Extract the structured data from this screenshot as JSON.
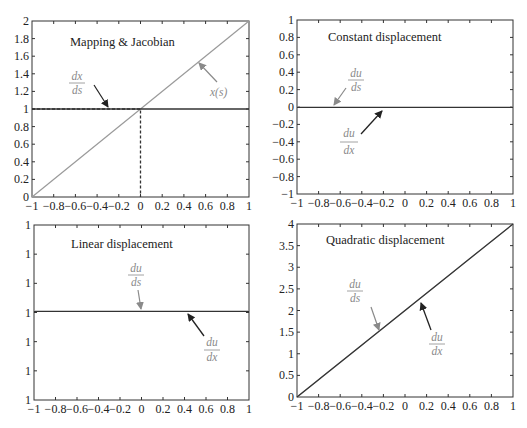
{
  "chart_data": [
    {
      "type": "line",
      "title": "Mapping & Jacobian",
      "xlabel": "",
      "ylabel": "",
      "xlim": [
        -1,
        1
      ],
      "ylim": [
        0,
        2
      ],
      "xticks": [
        "-1",
        "-0.8",
        "-0.6",
        "-0.4",
        "-0.2",
        "0",
        "0.2",
        "0.4",
        "0.6",
        "0.8",
        "1"
      ],
      "yticks": [
        "0",
        "0.2",
        "0.4",
        "0.6",
        "0.8",
        "1",
        "1.2",
        "1.4",
        "1.6",
        "1.8",
        "2"
      ],
      "grid": false,
      "series": [
        {
          "name": "x(s)",
          "color": "#9a9a9a",
          "x": [
            -1,
            1
          ],
          "y": [
            0,
            2
          ]
        },
        {
          "name": "dx/ds",
          "color": "#333333",
          "x": [
            -1,
            1
          ],
          "y": [
            1,
            1
          ]
        }
      ],
      "annotations": [
        {
          "label_top": "dx",
          "label_bottom": "ds",
          "target": "dx/ds line",
          "arrow_color": "#222222"
        },
        {
          "label": "x(s)",
          "target": "x(s) line",
          "arrow_color": "#8a8a8a"
        },
        {
          "type": "dashed-guide",
          "points": [
            [
              -1,
              1
            ],
            [
              0,
              1
            ],
            [
              0,
              0
            ]
          ]
        }
      ]
    },
    {
      "type": "line",
      "title": "Constant displacement",
      "xlim": [
        -1,
        1
      ],
      "ylim": [
        -1,
        1
      ],
      "xticks": [
        "-1",
        "-0.8",
        "-0.6",
        "-0.4",
        "-0.2",
        "0",
        "0.2",
        "0.4",
        "0.6",
        "0.8",
        "1"
      ],
      "yticks": [
        "-1",
        "-0.8",
        "-0.6",
        "-0.4",
        "-0.2",
        "0",
        "0.2",
        "0.4",
        "0.6",
        "0.8",
        "1"
      ],
      "grid": false,
      "series": [
        {
          "name": "du/ds",
          "color": "#9a9a9a",
          "x": [
            -1,
            1
          ],
          "y": [
            0,
            0
          ]
        },
        {
          "name": "du/dx",
          "color": "#333333",
          "x": [
            -1,
            1
          ],
          "y": [
            0,
            0
          ]
        }
      ],
      "annotations": [
        {
          "label_top": "du",
          "label_bottom": "ds",
          "arrow_color": "#8a8a8a"
        },
        {
          "label_top": "du",
          "label_bottom": "dx",
          "arrow_color": "#222222"
        }
      ]
    },
    {
      "type": "line",
      "title": "Linear displacement",
      "xlim": [
        -1,
        1
      ],
      "ylim": [
        1,
        1
      ],
      "xticks": [
        "-1",
        "-0.8",
        "-0.6",
        "-0.4",
        "-0.2",
        "0",
        "0.2",
        "0.4",
        "0.6",
        "0.8",
        "1"
      ],
      "yticks": [
        "1",
        "1",
        "1",
        "1",
        "1",
        "1",
        "1"
      ],
      "grid": false,
      "series": [
        {
          "name": "du/ds",
          "color": "#9a9a9a",
          "x": [
            -1,
            1
          ],
          "y": [
            1,
            1
          ]
        },
        {
          "name": "du/dx",
          "color": "#333333",
          "x": [
            -1,
            1
          ],
          "y": [
            1,
            1
          ]
        }
      ],
      "annotations": [
        {
          "label_top": "du",
          "label_bottom": "ds",
          "arrow_color": "#8a8a8a"
        },
        {
          "label_top": "du",
          "label_bottom": "dx",
          "arrow_color": "#222222"
        }
      ]
    },
    {
      "type": "line",
      "title": "Quadratic displacement",
      "xlim": [
        -1,
        1
      ],
      "ylim": [
        0,
        4
      ],
      "xticks": [
        "-1",
        "-0.8",
        "-0.6",
        "-0.4",
        "-0.2",
        "0",
        "0.2",
        "0.4",
        "0.6",
        "0.8",
        "1"
      ],
      "yticks": [
        "0",
        "0.5",
        "1",
        "1.5",
        "2",
        "2.5",
        "3",
        "3.5",
        "4"
      ],
      "grid": false,
      "series": [
        {
          "name": "du/ds",
          "color": "#9a9a9a",
          "x": [
            -1,
            1
          ],
          "y": [
            0,
            4
          ]
        },
        {
          "name": "du/dx",
          "color": "#333333",
          "x": [
            -1,
            1
          ],
          "y": [
            0,
            4
          ]
        }
      ],
      "annotations": [
        {
          "label_top": "du",
          "label_bottom": "ds",
          "arrow_color": "#8a8a8a"
        },
        {
          "label_top": "du",
          "label_bottom": "dx",
          "arrow_color": "#222222"
        }
      ]
    }
  ],
  "panels": {
    "p1": {
      "title": "Mapping & Jacobian",
      "ann1_top": "dx",
      "ann1_bottom": "ds",
      "ann2": "x(s)"
    },
    "p2": {
      "title": "Constant displacement",
      "ann1_top": "du",
      "ann1_bottom": "ds",
      "ann2_top": "du",
      "ann2_bottom": "dx"
    },
    "p3": {
      "title": "Linear displacement",
      "ann1_top": "du",
      "ann1_bottom": "ds",
      "ann2_top": "du",
      "ann2_bottom": "dx"
    },
    "p4": {
      "title": "Quadratic displacement",
      "ann1_top": "du",
      "ann1_bottom": "ds",
      "ann2_top": "du",
      "ann2_bottom": "dx"
    }
  },
  "colors": {
    "axis": "#333333",
    "gray_line": "#9a9a9a",
    "dark_line": "#333333",
    "annotation": "#8a8a8a"
  }
}
